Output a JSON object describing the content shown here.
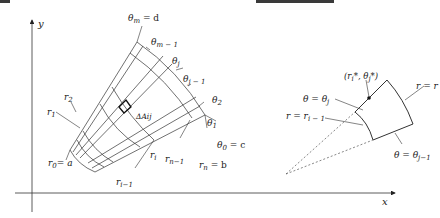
{
  "figure": {
    "left_panel": {
      "axes": {
        "x_label": "x",
        "y_label": "y"
      },
      "labels": {
        "theta_m": "θ",
        "theta_m_sub": "m",
        "theta_m_eq": " = d",
        "theta_m_minus_1": "θ",
        "theta_m_minus_1_sub": "m − 1",
        "theta_j": "θ",
        "theta_j_sub": "j",
        "theta_j_minus_1": "θ",
        "theta_j_minus_1_sub": "j − 1",
        "theta_2": "θ",
        "theta_2_sub": "2",
        "theta_1": "θ",
        "theta_1_sub": "1",
        "theta_0": "θ",
        "theta_0_sub": "0",
        "theta_0_eq": " = c",
        "r_0": "r",
        "r_0_sub": "0",
        "r_0_eq": "= a",
        "r_1": "r",
        "r_1_sub": "1",
        "r_2": "r",
        "r_2_sub": "2",
        "r_i": "r",
        "r_i_sub": "i",
        "r_i_minus_1": "r",
        "r_i_minus_1_sub": "i−1",
        "r_n_minus_1": "r",
        "r_n_minus_1_sub": "n−1",
        "r_n": "r",
        "r_n_sub": "n",
        "r_n_eq": " = b",
        "delta_A": "ΔAij"
      }
    },
    "right_panel": {
      "labels": {
        "theta_eq_theta_j": "θ = θ",
        "theta_eq_theta_j_sub": "j",
        "point": "(r",
        "point_sub1": "i",
        "point_mid": "*, θ",
        "point_sub2": "j",
        "point_end": "*)",
        "r_eq_r_i": "r = r",
        "r_eq_r_i_minus_1": "r = r",
        "r_eq_r_i_minus_1_sub": "i − 1",
        "theta_eq_theta_j_minus_1": "θ = θ",
        "theta_eq_theta_j_minus_1_sub": "j−1"
      }
    },
    "colors": {
      "ink": "#222222",
      "bar": "#3a3a3a",
      "background": "#ffffff"
    }
  }
}
